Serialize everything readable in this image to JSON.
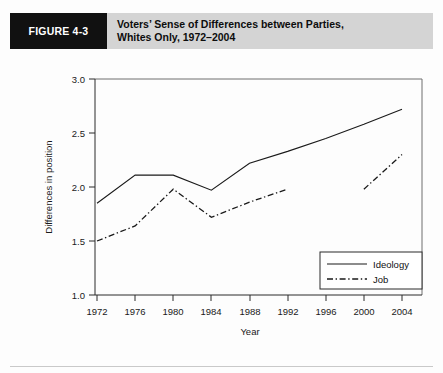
{
  "header": {
    "figure_tag": "FIGURE 4-3",
    "title_line1": "Voters’ Sense of Differences between Parties,",
    "title_line2": "Whites Only, 1972–2004",
    "tag_bg": "#111111",
    "band_bg": "#d4d4d4"
  },
  "chart_data": {
    "type": "line",
    "title": "Voters’ Sense of Differences between Parties, Whites Only, 1972–2004",
    "xlabel": "Year",
    "ylabel": "Differences in position",
    "x": [
      1972,
      1976,
      1980,
      1984,
      1988,
      1992,
      1996,
      2000,
      2004
    ],
    "xticklabels": [
      "1972",
      "1976",
      "1980",
      "1984",
      "1988",
      "1992",
      "1996",
      "2000",
      "2004"
    ],
    "yticklabels": [
      "1.0",
      "1.5",
      "2.0",
      "2.5",
      "3.0"
    ],
    "yticks": [
      1.0,
      1.5,
      2.0,
      2.5,
      3.0
    ],
    "xlim": [
      1972,
      2004
    ],
    "ylim": [
      1.0,
      3.0
    ],
    "grid": false,
    "legend_position": "lower right",
    "series": [
      {
        "name": "Ideology",
        "style": "solid",
        "x": [
          1972,
          1976,
          1980,
          1984,
          1988,
          1992,
          1996,
          2000,
          2004
        ],
        "values": [
          1.85,
          2.11,
          2.11,
          1.97,
          2.22,
          2.33,
          2.45,
          2.58,
          2.72
        ]
      },
      {
        "name": "Job",
        "style": "dash-dot",
        "x": [
          1972,
          1976,
          1980,
          1984,
          1988,
          1992
        ],
        "values": [
          1.5,
          1.64,
          1.98,
          1.72,
          1.86,
          1.98
        ]
      },
      {
        "name": "Job (2000-2004)",
        "style": "dash-dot",
        "x": [
          2000,
          2004
        ],
        "values": [
          1.98,
          2.3
        ]
      }
    ],
    "legend": [
      "Ideology",
      "Job"
    ]
  }
}
